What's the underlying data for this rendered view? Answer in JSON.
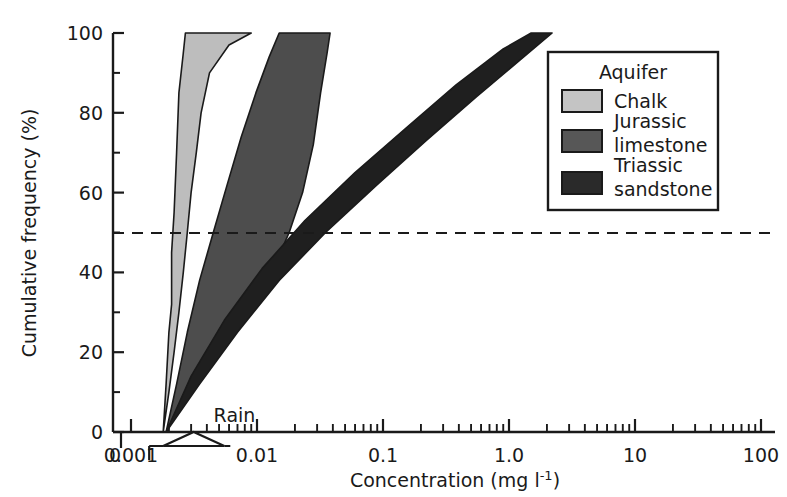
{
  "chart_data": {
    "type": "area",
    "title": "",
    "xlabel": "Concentration (mg l-1)",
    "xlabel_main": "Concentration (mg l",
    "xlabel_sup": "-1",
    "xlabel_tail": ")",
    "ylabel": "Cumulative frequency (%)",
    "xscale": "log",
    "xlim": [
      0.0005,
      100
    ],
    "ylim": [
      0,
      100
    ],
    "xticks": [
      "0",
      "0.001",
      "0.01",
      "0.1",
      "1.0",
      "10",
      "100"
    ],
    "xtick_values": [
      0,
      0.001,
      0.01,
      0.1,
      1.0,
      10,
      100
    ],
    "yticks": [
      "0",
      "20",
      "40",
      "60",
      "80",
      "100"
    ],
    "ytick_values": [
      0,
      20,
      40,
      60,
      80,
      100
    ],
    "yminor_values": [
      10,
      30,
      50,
      70,
      90
    ],
    "grid": false,
    "axis_break": true,
    "reference_lines": [
      {
        "name": "median-line",
        "orientation": "horizontal",
        "value": 50,
        "style": "dashed"
      }
    ],
    "annotations": [
      {
        "name": "rain-annotation",
        "label": "Rain",
        "x": 0.0035,
        "y": 6,
        "range_min": 0.0018,
        "range_max": 0.0055,
        "marker": "triangle"
      }
    ],
    "series": [
      {
        "name": "Chalk",
        "color": "#bdbdbd",
        "kind": "band",
        "description": "Chalk aquifer cumulative frequency envelope",
        "lower_curve": [
          {
            "x": 0.0018,
            "y": 0
          },
          {
            "x": 0.002,
            "y": 10
          },
          {
            "x": 0.0022,
            "y": 20
          },
          {
            "x": 0.0024,
            "y": 30
          },
          {
            "x": 0.0026,
            "y": 40
          },
          {
            "x": 0.0028,
            "y": 50
          },
          {
            "x": 0.003,
            "y": 60
          },
          {
            "x": 0.0033,
            "y": 70
          },
          {
            "x": 0.0036,
            "y": 80
          },
          {
            "x": 0.0042,
            "y": 90
          },
          {
            "x": 0.006,
            "y": 97
          },
          {
            "x": 0.009,
            "y": 100
          }
        ],
        "upper_curve": [
          {
            "x": 0.0018,
            "y": 0
          },
          {
            "x": 0.0019,
            "y": 12
          },
          {
            "x": 0.002,
            "y": 25
          },
          {
            "x": 0.0021,
            "y": 32
          },
          {
            "x": 0.0021,
            "y": 45
          },
          {
            "x": 0.0022,
            "y": 55
          },
          {
            "x": 0.0023,
            "y": 70
          },
          {
            "x": 0.0024,
            "y": 85
          },
          {
            "x": 0.0026,
            "y": 95
          },
          {
            "x": 0.0027,
            "y": 100
          }
        ]
      },
      {
        "name": "Jurassic limestone",
        "color": "#4d4d4d",
        "kind": "band",
        "description": "Jurassic limestone aquifer cumulative frequency envelope",
        "lower_curve": [
          {
            "x": 0.0019,
            "y": 0
          },
          {
            "x": 0.0028,
            "y": 10
          },
          {
            "x": 0.004,
            "y": 18
          },
          {
            "x": 0.006,
            "y": 25
          },
          {
            "x": 0.009,
            "y": 33
          },
          {
            "x": 0.013,
            "y": 40
          },
          {
            "x": 0.018,
            "y": 50
          },
          {
            "x": 0.023,
            "y": 60
          },
          {
            "x": 0.028,
            "y": 72
          },
          {
            "x": 0.032,
            "y": 85
          },
          {
            "x": 0.036,
            "y": 95
          },
          {
            "x": 0.038,
            "y": 100
          }
        ],
        "upper_curve": [
          {
            "x": 0.0019,
            "y": 0
          },
          {
            "x": 0.0023,
            "y": 12
          },
          {
            "x": 0.0028,
            "y": 25
          },
          {
            "x": 0.0035,
            "y": 38
          },
          {
            "x": 0.0045,
            "y": 50
          },
          {
            "x": 0.0058,
            "y": 62
          },
          {
            "x": 0.0075,
            "y": 74
          },
          {
            "x": 0.0098,
            "y": 85
          },
          {
            "x": 0.0125,
            "y": 94
          },
          {
            "x": 0.015,
            "y": 100
          }
        ]
      },
      {
        "name": "Triassic sandstone",
        "color": "#1f1f1f",
        "kind": "band",
        "description": "Triassic sandstone aquifer cumulative frequency envelope",
        "lower_curve": [
          {
            "x": 0.0019,
            "y": 0
          },
          {
            "x": 0.0035,
            "y": 12
          },
          {
            "x": 0.007,
            "y": 25
          },
          {
            "x": 0.015,
            "y": 38
          },
          {
            "x": 0.035,
            "y": 50
          },
          {
            "x": 0.09,
            "y": 62
          },
          {
            "x": 0.22,
            "y": 73
          },
          {
            "x": 0.55,
            "y": 84
          },
          {
            "x": 1.2,
            "y": 93
          },
          {
            "x": 2.2,
            "y": 100
          }
        ],
        "upper_curve": [
          {
            "x": 0.0019,
            "y": 0
          },
          {
            "x": 0.003,
            "y": 14
          },
          {
            "x": 0.0055,
            "y": 28
          },
          {
            "x": 0.011,
            "y": 41
          },
          {
            "x": 0.024,
            "y": 53
          },
          {
            "x": 0.06,
            "y": 65
          },
          {
            "x": 0.15,
            "y": 76
          },
          {
            "x": 0.38,
            "y": 87
          },
          {
            "x": 0.9,
            "y": 96
          },
          {
            "x": 1.5,
            "y": 100
          }
        ]
      }
    ]
  },
  "legend": {
    "name": "aquifer-legend",
    "title": "Aquifer",
    "position": "top-right",
    "items": [
      {
        "label": "Chalk",
        "label2": "",
        "color": "#c4c4c4"
      },
      {
        "label": "Jurassic",
        "label2": "limestone",
        "color": "#575757"
      },
      {
        "label": "Triassic",
        "label2": "sandstone",
        "color": "#2a2a2a"
      }
    ]
  }
}
